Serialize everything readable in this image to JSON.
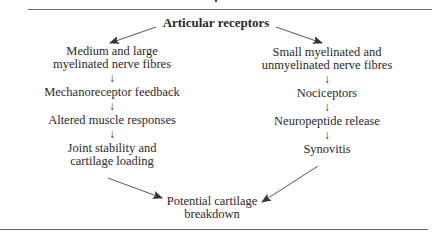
{
  "diagram": {
    "title": "Articular receptors",
    "left_branch": {
      "nodes": [
        {
          "lines": [
            "Medium and large",
            "myelinated nerve fibres"
          ]
        },
        {
          "lines": [
            "Mechanoreceptor feedback"
          ]
        },
        {
          "lines": [
            "Altered muscle responses"
          ]
        },
        {
          "lines": [
            "Joint stability and",
            "cartilage loading"
          ]
        }
      ]
    },
    "right_branch": {
      "nodes": [
        {
          "lines": [
            "Small myelinated and",
            "unmyelinated nerve fibres"
          ]
        },
        {
          "lines": [
            "Nociceptors"
          ]
        },
        {
          "lines": [
            "Neuropeptide release"
          ]
        },
        {
          "lines": [
            "Synovitis"
          ]
        }
      ]
    },
    "outcome": {
      "lines": [
        "Potential cartilage",
        "breakdown"
      ]
    },
    "arrow_glyph": "↓",
    "colors": {
      "text": "#2a2a2a",
      "rule": "#6a6a6a",
      "arrow": "#333333"
    }
  }
}
